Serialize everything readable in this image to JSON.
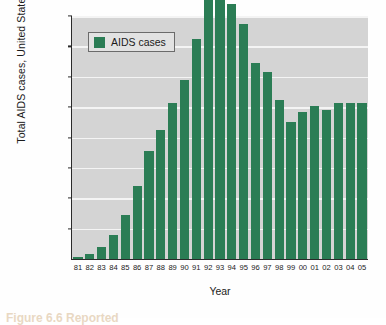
{
  "chart_data": {
    "type": "bar",
    "title": "",
    "xlabel": "Year",
    "ylabel": "Total AIDS cases, United States",
    "categories": [
      "81",
      "82",
      "83",
      "84",
      "85",
      "86",
      "87",
      "88",
      "89",
      "90",
      "91",
      "92",
      "93",
      "94",
      "95",
      "96",
      "97",
      "98",
      "99",
      "00",
      "01",
      "02",
      "03",
      "04",
      "05"
    ],
    "values": [
      500,
      2000,
      4500,
      8800,
      15000,
      25000,
      38000,
      45500,
      54500,
      62500,
      77500,
      101500,
      101500,
      90500,
      83000,
      69000,
      66000,
      56500,
      48500,
      52000,
      54000,
      52500,
      55000,
      55000,
      55000
    ],
    "series": [
      {
        "name": "AIDS cases",
        "values": [
          500,
          1600,
          4000,
          8000,
          14500,
          24000,
          35500,
          42500,
          51500,
          59000,
          72500,
          94000,
          94000,
          84000,
          77500,
          64500,
          61500,
          52500,
          45000,
          48500,
          50500,
          49000,
          51500,
          51500,
          51500
        ]
      }
    ],
    "ylim": [
      0,
      80000
    ],
    "ytick_values": [
      10000,
      20000,
      30000,
      40000,
      50000,
      60000,
      70000,
      80000
    ],
    "ytick_labels": [
      "10,000",
      "20,000",
      "30,000",
      "40,000",
      "50,000",
      "60,000",
      "70,000",
      "80,000"
    ],
    "grid": true,
    "grid_color": "#f4f4f4",
    "plot_background": "#d4d4d4",
    "bar_color": "#2b7d55",
    "legend_position": "top-left",
    "legend": [
      "AIDS cases"
    ]
  },
  "legend": {
    "label": "AIDS cases",
    "swatch_color": "#2b7d55"
  },
  "axes": {
    "y_title": "Total AIDS cases, United States",
    "x_title": "Year"
  },
  "caption": {
    "prefix": "Figure",
    "number": "6.6",
    "text": "Figure 6.6 Reported"
  }
}
